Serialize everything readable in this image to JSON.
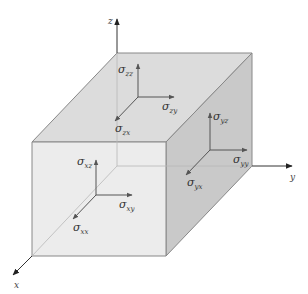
{
  "diagram": {
    "title": "",
    "colors": {
      "top_face": "#dcdcdc",
      "front_face": "#ececec",
      "side_face": "#c9c9c9",
      "edge": "#888888",
      "hidden_edge": "#b5b5b5",
      "arrow": "#555555",
      "text": "#333333"
    },
    "axes": {
      "x": {
        "label": "x"
      },
      "y": {
        "label": "y"
      },
      "z": {
        "label": "z"
      }
    },
    "faces": {
      "top": {
        "name": "z-face",
        "stresses": [
          {
            "symbol": "σ",
            "subscript": "zz",
            "direction": "up"
          },
          {
            "symbol": "σ",
            "subscript": "zy",
            "direction": "right"
          },
          {
            "symbol": "σ",
            "subscript": "zx",
            "direction": "down-left"
          }
        ]
      },
      "side": {
        "name": "y-face",
        "stresses": [
          {
            "symbol": "σ",
            "subscript": "yz",
            "direction": "up"
          },
          {
            "symbol": "σ",
            "subscript": "yy",
            "direction": "right"
          },
          {
            "symbol": "σ",
            "subscript": "yx",
            "direction": "down-left"
          }
        ]
      },
      "front": {
        "name": "x-face",
        "stresses": [
          {
            "symbol": "σ",
            "subscript": "xz",
            "direction": "up"
          },
          {
            "symbol": "σ",
            "subscript": "xy",
            "direction": "right"
          },
          {
            "symbol": "σ",
            "subscript": "xx",
            "direction": "down-left"
          }
        ]
      }
    }
  }
}
